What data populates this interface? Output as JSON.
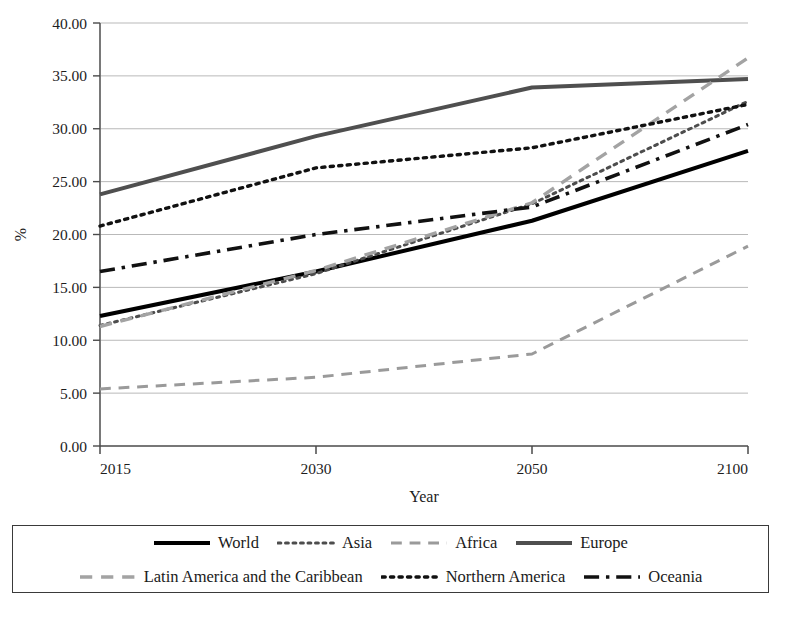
{
  "chart_data": {
    "type": "line",
    "title": "",
    "xlabel": "Year",
    "ylabel": "%",
    "categories": [
      "2015",
      "2030",
      "2050",
      "2100"
    ],
    "x_tick_labels": [
      "2015",
      "2030",
      "2050",
      "2100"
    ],
    "y_tick_labels": [
      "0.00",
      "5.00",
      "10.00",
      "15.00",
      "20.00",
      "25.00",
      "30.00",
      "35.00",
      "40.00"
    ],
    "ylim": [
      0,
      40
    ],
    "y_tick_step": 5,
    "grid": "horizontal",
    "legend_position": "bottom",
    "series": [
      {
        "name": "World",
        "style": "solid",
        "color": "#000000",
        "width": 4.0,
        "values": [
          12.3,
          16.5,
          21.3,
          27.9
        ]
      },
      {
        "name": "Asia",
        "style": "dotted",
        "color": "#4d4d4d",
        "width": 3.0,
        "values": [
          11.4,
          16.3,
          22.9,
          32.6
        ]
      },
      {
        "name": "Africa",
        "style": "dashed",
        "color": "#9a9a9a",
        "width": 3.0,
        "values": [
          5.4,
          6.5,
          8.7,
          18.9
        ]
      },
      {
        "name": "Europe",
        "style": "solid",
        "color": "#4f4f4f",
        "width": 4.0,
        "values": [
          23.8,
          29.3,
          33.9,
          34.7
        ]
      },
      {
        "name": "Latin America and the Caribbean",
        "style": "dashed",
        "color": "#a3a3a3",
        "width": 3.4,
        "values": [
          11.3,
          16.6,
          23.0,
          36.7
        ]
      },
      {
        "name": "Northern America",
        "style": "dotted",
        "color": "#111111",
        "width": 3.4,
        "values": [
          20.8,
          26.3,
          28.2,
          32.3
        ]
      },
      {
        "name": "Oceania",
        "style": "dashdot",
        "color": "#111111",
        "width": 3.6,
        "values": [
          16.5,
          20.0,
          22.6,
          30.4
        ]
      }
    ]
  },
  "legend": {
    "rows": [
      [
        {
          "label": "World",
          "series": "World"
        },
        {
          "label": "Asia",
          "series": "Asia"
        },
        {
          "label": "Africa",
          "series": "Africa"
        },
        {
          "label": "Europe",
          "series": "Europe"
        }
      ],
      [
        {
          "label": "Latin America and the Caribbean",
          "series": "Latin America and the Caribbean"
        },
        {
          "label": "Northern America",
          "series": "Northern America"
        },
        {
          "label": "Oceania",
          "series": "Oceania"
        }
      ]
    ]
  },
  "axes": {
    "y_title": "%",
    "x_title": "Year"
  }
}
